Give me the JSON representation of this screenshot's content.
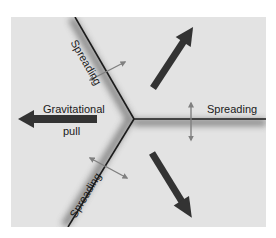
{
  "diagram": {
    "type": "triple-junction-rift",
    "colors": {
      "background": "#ffffff",
      "panel": "#e3e3e3",
      "ridge_line": "#1c1c1c",
      "ridge_shadow": "#777777",
      "big_arrow": "#333333",
      "small_arrow": "#808080"
    },
    "labels": {
      "ridge_top_left": "Spreading",
      "ridge_right": "Spreading",
      "ridge_bottom_left": "Spreading",
      "gravitational_line1": "Gravitational",
      "gravitational_line2": "pull"
    },
    "ridges": [
      {
        "name": "top-left",
        "from": [
          134,
          119
        ],
        "to": [
          75,
          17
        ]
      },
      {
        "name": "right",
        "from": [
          134,
          119
        ],
        "to": [
          266,
          119
        ]
      },
      {
        "name": "bottom-left",
        "from": [
          134,
          119
        ],
        "to": [
          68,
          227
        ]
      }
    ],
    "arrows": {
      "gravitational_pull": {
        "from": [
          97,
          119
        ],
        "to": [
          18,
          119
        ]
      },
      "plate_motion_upper_right": {
        "from": [
          153,
          88
        ],
        "to": [
          193,
          27
        ]
      },
      "plate_motion_lower_right": {
        "from": [
          152,
          153
        ],
        "to": [
          192,
          218
        ]
      },
      "spreading_top_left": {
        "from": [
          90,
          80
        ],
        "to": [
          125,
          62
        ]
      },
      "spreading_right": {
        "from": [
          191,
          103
        ],
        "to": [
          191,
          140
        ]
      },
      "spreading_bottom_left": {
        "from": [
          90,
          158
        ],
        "to": [
          127,
          178
        ]
      }
    }
  }
}
